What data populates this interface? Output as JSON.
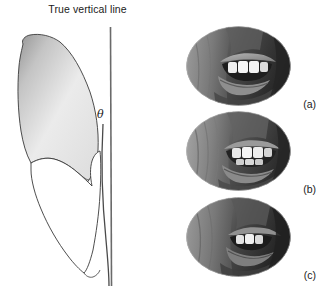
{
  "figure": {
    "domain_kind": "scientific-figure",
    "background_color": "#ffffff"
  },
  "diagram": {
    "title": "True vertical line",
    "angle_symbol": "θ",
    "vertical_line": {
      "name": "true-vertical-line",
      "color": "#555555",
      "x": 110,
      "y_top": 27,
      "y_bottom": 286
    },
    "inclined_line": {
      "name": "tooth-axis-line",
      "color": "#4a4a4a",
      "x_top": 103,
      "y_top": 124,
      "x_bottom": 109,
      "y_bottom": 286
    },
    "tooth": {
      "name": "tooth-outline",
      "crown_fill_light": "#f2f2f2",
      "crown_fill_dark": "#8c8c8c",
      "root_fill": "#ffffff",
      "stroke": "#3a3a3a"
    }
  },
  "photos": [
    {
      "caption": "(a)",
      "name": "photo-oval-a",
      "alt": "close-up oval photograph of smiling mouth showing upper teeth"
    },
    {
      "caption": "(b)",
      "name": "photo-oval-b",
      "alt": "close-up oval photograph of mouth showing upper and lower teeth"
    },
    {
      "caption": "(c)",
      "name": "photo-oval-c",
      "alt": "close-up oval photograph of mouth showing partially visible teeth"
    }
  ]
}
